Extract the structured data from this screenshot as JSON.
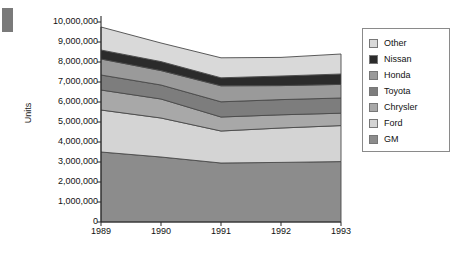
{
  "decoration": {
    "corner_block_color": "#7a7a7a"
  },
  "chart_data": {
    "type": "area",
    "stacked": true,
    "title": "",
    "xlabel": "",
    "ylabel": "Units",
    "categories": [
      "1989",
      "1990",
      "1991",
      "1992",
      "1993"
    ],
    "x_tick_labels": [
      "1989",
      "1990",
      "1991",
      "1992",
      "1993"
    ],
    "y_tick_labels": [
      "10,000,000",
      "9,000,000",
      "8,000,000",
      "7,000,000",
      "6,000,000",
      "5,000,000",
      "4,000,000",
      "3,000,000",
      "2,000,000",
      "1,000,000",
      "0"
    ],
    "y_tick_values": [
      10000000,
      9000000,
      8000000,
      7000000,
      6000000,
      5000000,
      4000000,
      3000000,
      2000000,
      1000000,
      0
    ],
    "ylim": [
      0,
      10000000
    ],
    "grid": false,
    "legend_position": "right",
    "stack_order_bottom_to_top": [
      "GM",
      "Ford",
      "Chrysler",
      "Toyota",
      "Honda",
      "Nissan",
      "Other"
    ],
    "series": [
      {
        "name": "GM",
        "color": "#8c8c8c",
        "values": [
          3500000,
          3250000,
          2950000,
          2980000,
          3020000
        ]
      },
      {
        "name": "Ford",
        "color": "#d4d4d4",
        "values": [
          2100000,
          1950000,
          1600000,
          1720000,
          1800000
        ]
      },
      {
        "name": "Chrysler",
        "color": "#a8a8a8",
        "values": [
          1000000,
          950000,
          700000,
          660000,
          620000
        ]
      },
      {
        "name": "Toyota",
        "color": "#7d7d7d",
        "values": [
          750000,
          700000,
          760000,
          760000,
          760000
        ]
      },
      {
        "name": "Honda",
        "color": "#9a9a9a",
        "values": [
          800000,
          720000,
          800000,
          700000,
          680000
        ]
      },
      {
        "name": "Nissan",
        "color": "#2b2b2b",
        "values": [
          450000,
          450000,
          400000,
          480000,
          520000
        ]
      },
      {
        "name": "Other",
        "color": "#d9d9d9",
        "values": [
          1150000,
          930000,
          1000000,
          930000,
          1000000
        ]
      }
    ],
    "cumulative_tops": {
      "GM": [
        3500000,
        3250000,
        2950000,
        2980000,
        3020000
      ],
      "Ford": [
        5600000,
        5200000,
        4550000,
        4700000,
        4820000
      ],
      "Chrysler": [
        6600000,
        6150000,
        5250000,
        5360000,
        5440000
      ],
      "Toyota": [
        7350000,
        6850000,
        6010000,
        6120000,
        6200000
      ],
      "Honda": [
        8150000,
        7570000,
        6810000,
        6820000,
        6880000
      ],
      "Nissan": [
        8600000,
        8020000,
        7210000,
        7300000,
        7400000
      ],
      "Other": [
        9750000,
        8950000,
        8210000,
        8230000,
        8400000
      ]
    }
  },
  "legend": {
    "items": [
      {
        "label": "Other",
        "color": "#d9d9d9"
      },
      {
        "label": "Nissan",
        "color": "#2b2b2b"
      },
      {
        "label": "Honda",
        "color": "#9a9a9a"
      },
      {
        "label": "Toyota",
        "color": "#7d7d7d"
      },
      {
        "label": "Chrysler",
        "color": "#a8a8a8"
      },
      {
        "label": "Ford",
        "color": "#d4d4d4"
      },
      {
        "label": "GM",
        "color": "#8c8c8c"
      }
    ]
  }
}
